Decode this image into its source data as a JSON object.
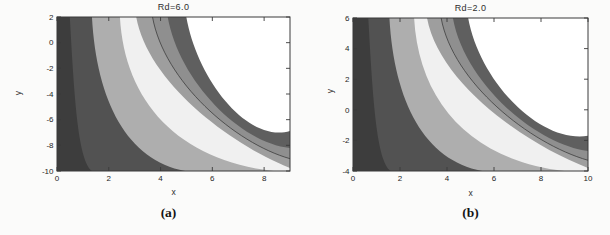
{
  "style": {
    "page_background": "#fbfbfa",
    "plot_outside_color": "#ffffff",
    "band_colors": [
      "#3d3d3d",
      "#525252",
      "#aeaeae",
      "#f0f0f0",
      "#9e9e9e",
      "#8f8f8f",
      "#5f5f5f"
    ],
    "contour_line_color": "#3e3e3e",
    "axis_color": "#3a3a3a",
    "tick_label_color": "#262626"
  },
  "chart_data": [
    {
      "type": "contour",
      "title": "Rd=6.0",
      "caption": "(a)",
      "xlabel": "x",
      "ylabel": "y",
      "x_range": [
        0,
        9
      ],
      "x_ticks": [
        0,
        2,
        4,
        6,
        8
      ],
      "y_range": [
        -10,
        2
      ],
      "y_ticks": [
        2,
        0,
        -2,
        -4,
        -6,
        -8,
        -10
      ],
      "legend": "grayscale filled contour bands, nested hyperbola-like level curves, white region at upper right",
      "boundaries": [
        {
          "top_frac": 0.055,
          "exit": "bottom",
          "exit_frac": 0.15
        },
        {
          "top_frac": 0.15,
          "exit": "bottom",
          "exit_frac": 0.55
        },
        {
          "top_frac": 0.27,
          "exit": "bottom",
          "exit_frac": 0.93
        },
        {
          "top_frac": 0.34,
          "exit": "right",
          "exit_frac": 0.02
        },
        {
          "top_frac": 0.41,
          "exit": "right",
          "exit_frac": 0.08,
          "contour_line": true
        },
        {
          "top_frac": 0.475,
          "exit": "right",
          "exit_frac": 0.15
        },
        {
          "top_frac": 0.555,
          "exit": "right",
          "exit_frac": 0.26
        }
      ]
    },
    {
      "type": "contour",
      "title": "Rd=2.0",
      "caption": "(b)",
      "xlabel": "x",
      "ylabel": "y",
      "x_range": [
        0,
        10
      ],
      "x_ticks": [
        0,
        2,
        4,
        6,
        8,
        10
      ],
      "y_range": [
        -4,
        6
      ],
      "y_ticks": [
        6,
        4,
        2,
        0,
        -2,
        -4
      ],
      "legend": "grayscale filled contour bands, nested hyperbola-like level curves, white region at upper right",
      "boundaries": [
        {
          "top_frac": 0.065,
          "exit": "bottom",
          "exit_frac": 0.16
        },
        {
          "top_frac": 0.155,
          "exit": "bottom",
          "exit_frac": 0.55
        },
        {
          "top_frac": 0.26,
          "exit": "bottom",
          "exit_frac": 0.9
        },
        {
          "top_frac": 0.315,
          "exit": "right",
          "exit_frac": 0.02
        },
        {
          "top_frac": 0.375,
          "exit": "right",
          "exit_frac": 0.07,
          "contour_line": true
        },
        {
          "top_frac": 0.425,
          "exit": "right",
          "exit_frac": 0.13
        },
        {
          "top_frac": 0.49,
          "exit": "right",
          "exit_frac": 0.23
        }
      ]
    }
  ]
}
